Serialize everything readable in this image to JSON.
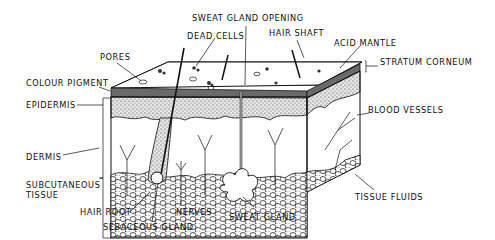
{
  "labels": {
    "sweat_gland_opening": "SWEAT GLAND OPENING",
    "dead_cells": "DEAD CELLS",
    "hair_shaft": "HAIR SHAFT",
    "pores": "PORES",
    "acid_mantle": "ACID MANTLE",
    "stratum_corneum": "STRATUM CORNEUM",
    "colour_pigment": "COLOUR PIGMENT",
    "epidermis": "EPIDERMIS",
    "blood_vessels": "BLOOD VESSELS",
    "dermis": "DERMIS",
    "subcutaneous_1": "SUBCUTANEOUS",
    "subcutaneous_2": "TISSUE",
    "tissue_fluids": "TISSUE FLUIDS",
    "hair_root": "HAIR ROOT",
    "nerves": "NERVES",
    "sweat_gland": "SWEAT GLAND",
    "sebaceous_gland": "SEBACEOUS GLAND"
  },
  "colors": {
    "ink": "#111111",
    "pigment_band": "#6a6a6a",
    "epidermis_fill": "#cfcfcf",
    "background": "#ffffff"
  }
}
